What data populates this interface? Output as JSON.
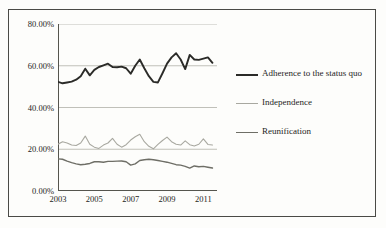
{
  "chart_data": {
    "type": "line",
    "title": "",
    "subtitle": "",
    "xlabel": "",
    "ylabel": "",
    "xlim": [
      2003,
      2011.75
    ],
    "ylim": [
      0,
      80
    ],
    "grid": true,
    "grid_axis": "y",
    "legend_position": "right",
    "y_tick_labels": [
      "80.00%",
      "60.00%",
      "40.00%",
      "20.00%",
      "0.00%"
    ],
    "y_tick_values": [
      80,
      60,
      40,
      20,
      0
    ],
    "x_tick_labels": [
      "2003",
      "2005",
      "2007",
      "2009",
      "2011"
    ],
    "x_tick_values": [
      2003,
      2005,
      2007,
      2009,
      2011
    ],
    "x": [
      2003.0,
      2003.25,
      2003.5,
      2003.75,
      2004.0,
      2004.25,
      2004.5,
      2004.75,
      2005.0,
      2005.25,
      2005.5,
      2005.75,
      2006.0,
      2006.25,
      2006.5,
      2006.75,
      2007.0,
      2007.25,
      2007.5,
      2007.75,
      2008.0,
      2008.25,
      2008.5,
      2008.75,
      2009.0,
      2009.25,
      2009.5,
      2009.75,
      2010.0,
      2010.25,
      2010.5,
      2010.75,
      2011.0,
      2011.25,
      2011.5
    ],
    "series": [
      {
        "name": "Adherence to the status quo",
        "color": "#2b2b28",
        "values": [
          52.3,
          51.6,
          52.0,
          52.4,
          53.3,
          55.0,
          58.6,
          55.4,
          58.0,
          59.4,
          60.2,
          61.0,
          59.4,
          59.3,
          59.6,
          58.8,
          56.2,
          60.0,
          63.0,
          58.8,
          55.0,
          52.3,
          52.0,
          56.4,
          61.0,
          64.0,
          66.0,
          63.0,
          58.4,
          65.2,
          63.0,
          62.8,
          63.4,
          64.0,
          61.4
        ]
      },
      {
        "name": "Independence",
        "color": "#a8a8a0",
        "values": [
          22.4,
          23.6,
          23.0,
          22.0,
          21.8,
          23.0,
          26.3,
          22.4,
          21.0,
          20.4,
          22.0,
          23.0,
          25.2,
          22.4,
          21.0,
          22.2,
          24.4,
          26.0,
          27.2,
          23.6,
          21.4,
          20.2,
          22.3,
          24.2,
          25.8,
          23.6,
          22.4,
          22.0,
          24.0,
          22.2,
          21.6,
          22.4,
          25.0,
          22.3,
          22.0
        ]
      },
      {
        "name": "Reunification",
        "color": "#6e6e66",
        "values": [
          15.4,
          15.2,
          14.3,
          13.6,
          13.0,
          12.6,
          12.8,
          13.2,
          14.0,
          14.0,
          13.8,
          14.2,
          14.2,
          14.3,
          14.4,
          14.0,
          12.4,
          13.0,
          14.6,
          15.0,
          15.2,
          15.0,
          14.6,
          14.2,
          13.8,
          13.2,
          12.6,
          12.4,
          11.8,
          11.0,
          12.0,
          11.6,
          11.8,
          11.4,
          11.0
        ]
      }
    ]
  },
  "legend": {
    "items": [
      {
        "label": "Adherence to the status quo"
      },
      {
        "label": "Independence"
      },
      {
        "label": "Reunification"
      }
    ]
  }
}
